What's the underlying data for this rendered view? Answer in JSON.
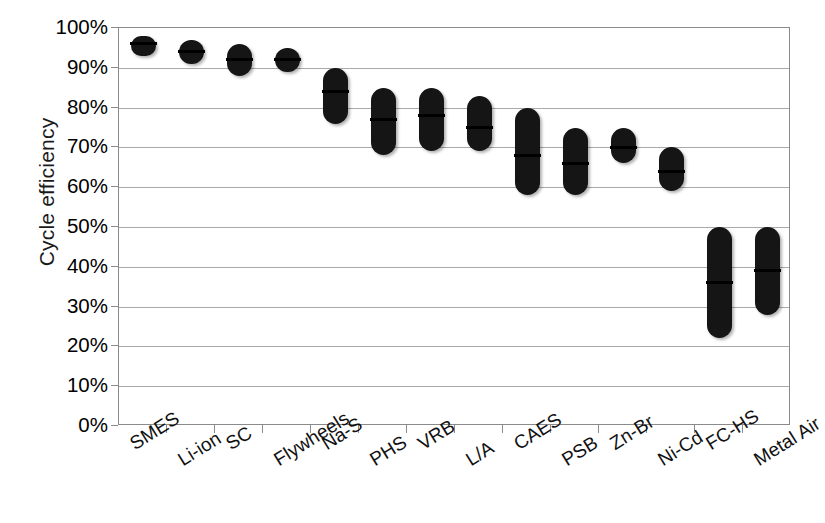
{
  "chart_data": {
    "type": "bar",
    "title": "",
    "xlabel": "",
    "ylabel": "Cycle efficiency",
    "ylim": [
      0,
      1.0
    ],
    "ytick_labels": [
      "100%",
      "90%",
      "80%",
      "70%",
      "60%",
      "50%",
      "40%",
      "30%",
      "20%",
      "10%",
      "0%"
    ],
    "ytick_values": [
      100,
      90,
      80,
      70,
      60,
      50,
      40,
      30,
      20,
      10,
      0
    ],
    "grid": true,
    "legend": "none",
    "value_unit": "percent",
    "series_description": "Range (low-high) of cycle efficiency with median marker per storage technology",
    "categories": [
      "SMES",
      "Li-ion",
      "SC",
      "Flywheels",
      "Na-S",
      "PHS",
      "VRB",
      "L/A",
      "CAES",
      "PSB",
      "Zn-Br",
      "Ni-Cd",
      "FC-HS",
      "Metal Air"
    ],
    "ranges": [
      {
        "category": "SMES",
        "low": 93,
        "high": 98,
        "median": 96
      },
      {
        "category": "Li-ion",
        "low": 91,
        "high": 97,
        "median": 94
      },
      {
        "category": "SC",
        "low": 88,
        "high": 96,
        "median": 92
      },
      {
        "category": "Flywheels",
        "low": 89,
        "high": 95,
        "median": 92
      },
      {
        "category": "Na-S",
        "low": 76,
        "high": 90,
        "median": 84
      },
      {
        "category": "PHS",
        "low": 68,
        "high": 85,
        "median": 77
      },
      {
        "category": "VRB",
        "low": 69,
        "high": 85,
        "median": 78
      },
      {
        "category": "L/A",
        "low": 69,
        "high": 83,
        "median": 75
      },
      {
        "category": "CAES",
        "low": 58,
        "high": 80,
        "median": 68
      },
      {
        "category": "PSB",
        "low": 58,
        "high": 75,
        "median": 66
      },
      {
        "category": "Zn-Br",
        "low": 66,
        "high": 75,
        "median": 70
      },
      {
        "category": "Ni-Cd",
        "low": 59,
        "high": 70,
        "median": 64
      },
      {
        "category": "FC-HS",
        "low": 22,
        "high": 50,
        "median": 36
      },
      {
        "category": "Metal Air",
        "low": 28,
        "high": 50,
        "median": 39
      }
    ]
  }
}
